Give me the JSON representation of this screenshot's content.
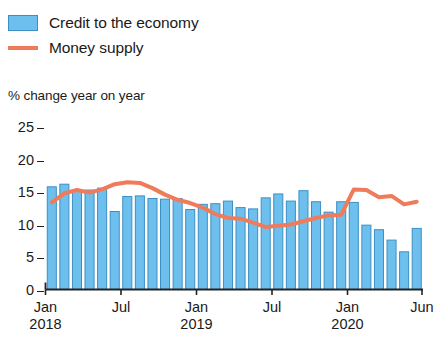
{
  "legend": {
    "items": [
      {
        "label": "Credit to the economy",
        "type": "bar",
        "color": "#6DC0EE",
        "border": "#3C8FC4",
        "icon": "bar-swatch-icon"
      },
      {
        "label": "Money supply",
        "type": "line",
        "color": "#F07B5A",
        "icon": "line-swatch-icon"
      }
    ]
  },
  "axis_title": "% change year on year",
  "chart_data": {
    "type": "bar",
    "title": "",
    "subtitle": "",
    "xlabel": "",
    "ylabel": "% change year on year",
    "ylim": [
      0,
      25
    ],
    "yticks": [
      0,
      5,
      10,
      15,
      20,
      25
    ],
    "ytick_labels": [
      "0",
      "5",
      "10",
      "15",
      "20",
      "25"
    ],
    "grid": false,
    "legend_position": "top-left",
    "x": [
      "Jan 2018",
      "Feb 2018",
      "Mar 2018",
      "Apr 2018",
      "May 2018",
      "Jun 2018",
      "Jul 2018",
      "Aug 2018",
      "Sep 2018",
      "Oct 2018",
      "Nov 2018",
      "Dec 2018",
      "Jan 2019",
      "Feb 2019",
      "Mar 2019",
      "Apr 2019",
      "May 2019",
      "Jun 2019",
      "Jul 2019",
      "Aug 2019",
      "Sep 2019",
      "Oct 2019",
      "Nov 2019",
      "Dec 2019",
      "Jan 2020",
      "Feb 2020",
      "Mar 2020",
      "Apr 2020",
      "May 2020",
      "Jun 2020"
    ],
    "xtick_labels": [
      {
        "month": "Jan",
        "year": "2018",
        "index": 0
      },
      {
        "month": "Jul",
        "year": "",
        "index": 6
      },
      {
        "month": "Jan",
        "year": "2019",
        "index": 12
      },
      {
        "month": "Jul",
        "year": "",
        "index": 18
      },
      {
        "month": "Jan",
        "year": "2020",
        "index": 24
      },
      {
        "month": "Jun",
        "year": "",
        "index": 29
      }
    ],
    "series": [
      {
        "name": "Credit to the economy",
        "type": "bar",
        "color": "#6DC0EE",
        "border_color": "#3C8FC4",
        "values": [
          15.8,
          16.2,
          15.2,
          15.3,
          15.6,
          12.0,
          14.3,
          14.4,
          14.0,
          13.9,
          14.0,
          12.3,
          13.1,
          13.2,
          13.6,
          12.6,
          12.4,
          14.1,
          14.7,
          13.6,
          15.2,
          13.5,
          11.9,
          13.5,
          13.4,
          9.9,
          9.2,
          7.6,
          5.8,
          9.4
        ]
      },
      {
        "name": "Money supply",
        "type": "line",
        "color": "#F07B5A",
        "values": [
          13.4,
          14.8,
          15.3,
          14.9,
          15.4,
          16.2,
          16.5,
          16.4,
          15.6,
          14.6,
          13.8,
          13.3,
          12.6,
          11.6,
          11.0,
          10.9,
          10.3,
          9.6,
          9.8,
          10.0,
          10.5,
          11.0,
          11.4,
          11.5,
          15.4,
          15.3,
          14.2,
          14.4,
          13.1,
          13.5
        ]
      }
    ]
  }
}
